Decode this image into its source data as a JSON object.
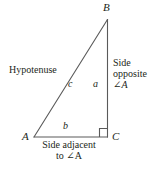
{
  "figure": {
    "stroke_color": "#5a5a5a",
    "text_color": "#231f20",
    "background_color": "#ffffff",
    "vertices": {
      "a": {
        "label": "A",
        "x": 34,
        "y": 137
      },
      "b": {
        "label": "B",
        "x": 107,
        "y": 20
      },
      "c": {
        "label": "C",
        "x": 107,
        "y": 137
      }
    },
    "sides": {
      "opposite": {
        "label": "a",
        "from": "B",
        "to": "C"
      },
      "adjacent": {
        "label": "b",
        "from": "A",
        "to": "C"
      },
      "hypotenuse": {
        "label": "c",
        "from": "A",
        "to": "B"
      }
    },
    "right_angle_marker": {
      "at": "C",
      "size": 8
    },
    "annotations": {
      "hypotenuse": "Hypotenuse",
      "side_opposite_line1": "Side",
      "side_opposite_line2": "opposite",
      "side_opposite_line3": "∠A",
      "side_adjacent_line1": "Side adjacent",
      "side_adjacent_line2": "to ∠A"
    }
  }
}
